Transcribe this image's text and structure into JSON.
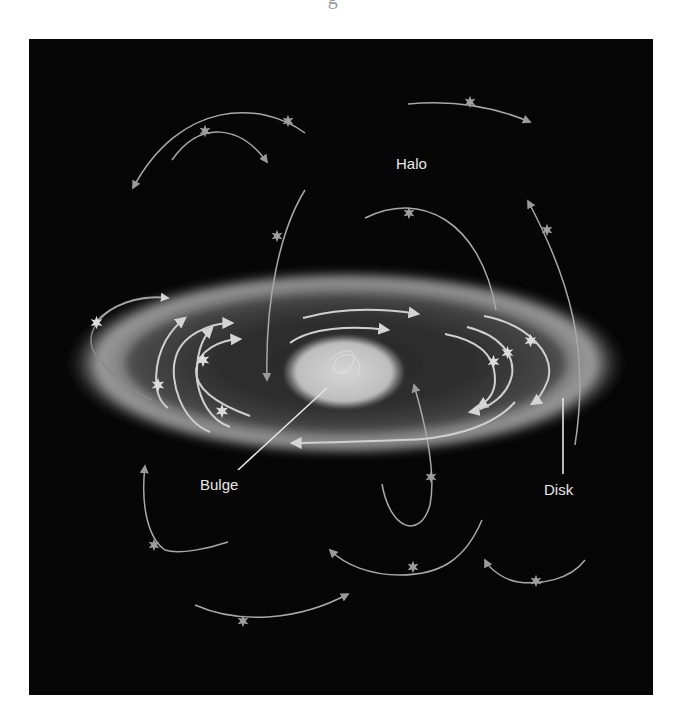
{
  "figure": {
    "title_fragment": "· · · · · · · · · · · · · · g · · · · · · · · · · · · · · ·",
    "labels": {
      "halo": "Halo",
      "bulge": "Bulge",
      "disk": "Disk"
    },
    "colors": {
      "background": "#060606",
      "page": "#ffffff",
      "disk_glow": "#9a9a9a",
      "disk_inner": "#3a3a3a",
      "bulge": "#cfcfcf",
      "orbit_line": "#c8c8c8",
      "label_text": "#e6e6e6"
    }
  }
}
